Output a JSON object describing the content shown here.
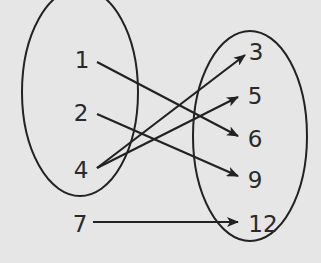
{
  "diagram": {
    "type": "mapping",
    "domain": {
      "label": "domain",
      "values": [
        "1",
        "2",
        "4",
        "7"
      ]
    },
    "range": {
      "label": "range",
      "values": [
        "3",
        "5",
        "6",
        "9",
        "12"
      ]
    },
    "mappings": [
      {
        "from": "1",
        "to": "6"
      },
      {
        "from": "2",
        "to": "9"
      },
      {
        "from": "4",
        "to": "3"
      },
      {
        "from": "4",
        "to": "5"
      },
      {
        "from": "7",
        "to": "12"
      }
    ],
    "colors": {
      "background": "#e6e6e6",
      "stroke": "#222222",
      "text": "#2a2a2a"
    }
  }
}
